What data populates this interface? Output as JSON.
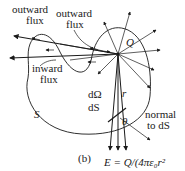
{
  "figure": {
    "panel_label": "(b)",
    "charge_label": "Q",
    "surface_label": "S",
    "labels": {
      "outward_flux_left_line1": "outward",
      "outward_flux_left_line2": "flux",
      "outward_flux_right_line1": "outward",
      "outward_flux_right_line2": "flux",
      "inward_flux_line1": "inward",
      "inward_flux_line2": "flux",
      "solid_angle": "dΩ",
      "area_element": "dS",
      "normal_line1": "normal",
      "normal_line2": "to dS",
      "angle": "θ",
      "distance": "r",
      "field_equation": "E = Q/(4πε₀r²"
    },
    "colors": {
      "ink": "#1a1a1a",
      "background": "#ffffff"
    }
  }
}
